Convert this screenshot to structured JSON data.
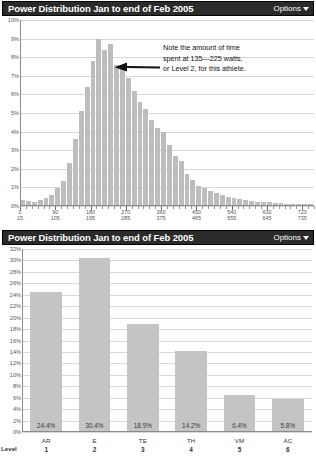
{
  "top_panel": {
    "title": "Power Distribution Jan to end of Feb 2005",
    "options_label": "Options",
    "caret_icon": "chevron-down-icon",
    "annotation": {
      "line1": "Note the amount of time",
      "line2": "spent at 135—225 watts,",
      "line3": "or Level 2, for this athlete."
    },
    "arrow_icon": "left-arrow-icon"
  },
  "bottom_panel": {
    "title": "Power Distribution Jan to end of Feb 2005",
    "options_label": "Options",
    "caret_icon": "chevron-down-icon",
    "axis_corner_label": "Level"
  },
  "chart_data": [
    {
      "type": "bar",
      "title": "Power Distribution Jan to end of Feb 2005",
      "subtitle": "",
      "xlabel": "",
      "ylabel": "",
      "ylim": [
        0,
        10
      ],
      "ytick_labels": [
        "0%",
        "1%",
        "2%",
        "3%",
        "4%",
        "5%",
        "6%",
        "7%",
        "8%",
        "9%",
        "10%"
      ],
      "ytick_values": [
        0,
        1,
        2,
        3,
        4,
        5,
        6,
        7,
        8,
        9,
        10
      ],
      "grid": true,
      "legend": "none",
      "xtick_labels": [
        {
          "lo": "0",
          "hi": "15",
          "pos": 0
        },
        {
          "lo": "90",
          "hi": "105",
          "pos": 6
        },
        {
          "lo": "180",
          "hi": "195",
          "pos": 12
        },
        {
          "lo": "270",
          "hi": "285",
          "pos": 18
        },
        {
          "lo": "360",
          "hi": "375",
          "pos": 24
        },
        {
          "lo": "450",
          "hi": "465",
          "pos": 30
        },
        {
          "lo": "540",
          "hi": "555",
          "pos": 36
        },
        {
          "lo": "630",
          "hi": "645",
          "pos": 42
        },
        {
          "lo": "720",
          "hi": "735",
          "pos": 48
        }
      ],
      "categories": [
        "0-15",
        "15-30",
        "30-45",
        "45-60",
        "60-75",
        "75-90",
        "90-105",
        "105-120",
        "120-135",
        "135-150",
        "150-165",
        "165-180",
        "180-195",
        "195-210",
        "210-225",
        "225-240",
        "240-255",
        "255-270",
        "270-285",
        "285-300",
        "300-315",
        "315-330",
        "330-345",
        "345-360",
        "360-375",
        "375-390",
        "390-405",
        "405-420",
        "420-435",
        "435-450",
        "450-465",
        "465-480",
        "480-495",
        "495-510",
        "510-525",
        "525-540",
        "540-555",
        "555-570",
        "570-585",
        "585-600",
        "600-615",
        "615-630",
        "630-645",
        "645-660",
        "660-675",
        "675-690",
        "690-705",
        "705-720",
        "720-735",
        "735-750"
      ],
      "values": [
        0.35,
        0.25,
        0.2,
        0.3,
        0.45,
        0.6,
        0.95,
        1.35,
        2.3,
        3.6,
        5.1,
        6.4,
        7.8,
        9.0,
        8.4,
        8.7,
        7.6,
        7.5,
        6.9,
        6.2,
        5.6,
        5.2,
        4.6,
        4.2,
        4.0,
        3.3,
        2.7,
        2.4,
        1.7,
        1.4,
        1.1,
        0.95,
        0.8,
        0.7,
        0.6,
        0.5,
        0.42,
        0.36,
        0.3,
        0.27,
        0.24,
        0.21,
        0.19,
        0.17,
        0.15,
        0.13,
        0.12,
        0.11,
        0.1,
        0.09
      ]
    },
    {
      "type": "bar",
      "title": "Power Distribution Jan to end of Feb 2005",
      "subtitle": "",
      "xlabel": "Level",
      "ylabel": "",
      "ylim": [
        0,
        32
      ],
      "ytick_labels": [
        "0%",
        "2%",
        "4%",
        "6%",
        "8%",
        "10%",
        "12%",
        "14%",
        "16%",
        "18%",
        "20%",
        "22%",
        "24%",
        "26%",
        "28%",
        "30%",
        "32%"
      ],
      "ytick_values": [
        0,
        2,
        4,
        6,
        8,
        10,
        12,
        14,
        16,
        18,
        20,
        22,
        24,
        26,
        28,
        30,
        32
      ],
      "grid": true,
      "legend": "none",
      "categories": [
        "AR",
        "E",
        "TE",
        "TH",
        "VM",
        "AC"
      ],
      "level_numbers": [
        "1",
        "2",
        "3",
        "4",
        "5",
        "6"
      ],
      "values": [
        24.4,
        30.4,
        18.9,
        14.2,
        6.4,
        5.8
      ],
      "value_labels": [
        "24.4%",
        "30.4%",
        "18.9%",
        "14.2%",
        "6.4%",
        "5.8%"
      ]
    }
  ]
}
